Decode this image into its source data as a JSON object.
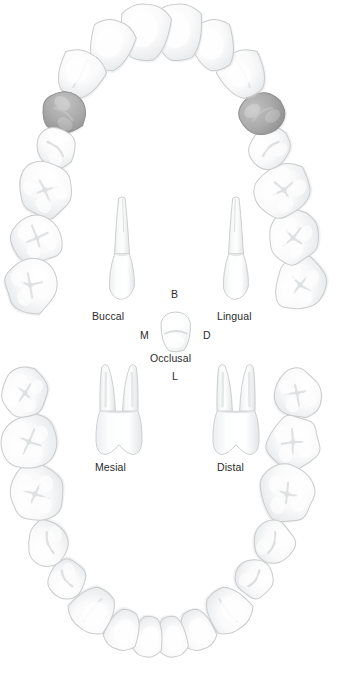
{
  "figure": {
    "type": "dental-arch-anatomy-diagram",
    "width": 346,
    "height": 676,
    "background_color": "#ffffff"
  },
  "colors": {
    "tooth_fill": "#fbfbfb",
    "tooth_outline": "#c9cbcc",
    "tooth_shade": "#e9eaeb",
    "highlight_fill": "#a9a9a9",
    "highlight_outline": "#8f8f8f",
    "label_text": "#2b2b2b"
  },
  "view_labels": {
    "buccal": "Buccal",
    "lingual": "Lingual",
    "mesial": "Mesial",
    "distal": "Distal",
    "occlusal": "Occlusal"
  },
  "orientation_labels": {
    "b": "B",
    "m": "M",
    "d": "D",
    "l": "L"
  },
  "arches": {
    "upper": {
      "name": "maxillary-arch",
      "teeth": [
        {
          "id": "ur8",
          "name": "upper-right-third-molar",
          "highlighted": false,
          "cx": 300,
          "cy": 285,
          "rx": 28,
          "ry": 26,
          "rot": -72,
          "crown": "molar"
        },
        {
          "id": "ur7",
          "name": "upper-right-second-molar",
          "highlighted": false,
          "cx": 293,
          "cy": 238,
          "rx": 27,
          "ry": 25,
          "rot": -62,
          "crown": "molar"
        },
        {
          "id": "ur6",
          "name": "upper-right-first-molar",
          "highlighted": false,
          "cx": 284,
          "cy": 190,
          "rx": 29,
          "ry": 28,
          "rot": -52,
          "crown": "molar"
        },
        {
          "id": "ur5",
          "name": "upper-right-second-premolar",
          "highlighted": false,
          "cx": 270,
          "cy": 148,
          "rx": 22,
          "ry": 21,
          "rot": -42,
          "crown": "premolar"
        },
        {
          "id": "ur4",
          "name": "upper-right-first-premolar",
          "highlighted": true,
          "cx": 262,
          "cy": 113,
          "rx": 23,
          "ry": 21,
          "rot": -34,
          "crown": "premolar"
        },
        {
          "id": "ur3",
          "name": "upper-right-canine",
          "highlighted": false,
          "cx": 243,
          "cy": 74,
          "rx": 23,
          "ry": 24,
          "rot": -28,
          "crown": "canine"
        },
        {
          "id": "ur2",
          "name": "upper-right-lateral-incisor",
          "highlighted": false,
          "cx": 213,
          "cy": 45,
          "rx": 22,
          "ry": 26,
          "rot": -18,
          "crown": "incisor"
        },
        {
          "id": "ur1",
          "name": "upper-right-central-incisor",
          "highlighted": false,
          "cx": 178,
          "cy": 32,
          "rx": 25,
          "ry": 29,
          "rot": -6,
          "crown": "incisor"
        },
        {
          "id": "ul1",
          "name": "upper-left-central-incisor",
          "highlighted": false,
          "cx": 145,
          "cy": 32,
          "rx": 25,
          "ry": 29,
          "rot": 6,
          "crown": "incisor"
        },
        {
          "id": "ul2",
          "name": "upper-left-lateral-incisor",
          "highlighted": false,
          "cx": 111,
          "cy": 45,
          "rx": 22,
          "ry": 26,
          "rot": 18,
          "crown": "incisor"
        },
        {
          "id": "ul3",
          "name": "upper-left-canine",
          "highlighted": false,
          "cx": 80,
          "cy": 74,
          "rx": 23,
          "ry": 24,
          "rot": 28,
          "crown": "canine"
        },
        {
          "id": "ul4",
          "name": "upper-left-first-premolar",
          "highlighted": true,
          "cx": 64,
          "cy": 113,
          "rx": 23,
          "ry": 21,
          "rot": 34,
          "crown": "premolar"
        },
        {
          "id": "ul5",
          "name": "upper-left-second-premolar",
          "highlighted": false,
          "cx": 56,
          "cy": 148,
          "rx": 22,
          "ry": 21,
          "rot": 42,
          "crown": "premolar"
        },
        {
          "id": "ul6",
          "name": "upper-left-first-molar",
          "highlighted": false,
          "cx": 45,
          "cy": 190,
          "rx": 29,
          "ry": 28,
          "rot": 52,
          "crown": "molar"
        },
        {
          "id": "ul7",
          "name": "upper-left-second-molar",
          "highlighted": false,
          "cx": 37,
          "cy": 238,
          "rx": 27,
          "ry": 25,
          "rot": 62,
          "crown": "molar"
        },
        {
          "id": "ul8",
          "name": "upper-left-third-molar",
          "highlighted": false,
          "cx": 30,
          "cy": 285,
          "rx": 28,
          "ry": 26,
          "rot": 72,
          "crown": "molar"
        }
      ]
    },
    "lower": {
      "name": "mandibular-arch",
      "teeth": [
        {
          "id": "lr8",
          "name": "lower-right-third-molar",
          "highlighted": false,
          "cx": 297,
          "cy": 393,
          "rx": 26,
          "ry": 24,
          "rot": 70,
          "crown": "molar"
        },
        {
          "id": "lr7",
          "name": "lower-right-second-molar",
          "highlighted": false,
          "cx": 293,
          "cy": 442,
          "rx": 28,
          "ry": 27,
          "rot": 78,
          "crown": "molar"
        },
        {
          "id": "lr6",
          "name": "lower-right-first-molar",
          "highlighted": false,
          "cx": 287,
          "cy": 494,
          "rx": 29,
          "ry": 28,
          "rot": 86,
          "crown": "molar"
        },
        {
          "id": "lr5",
          "name": "lower-right-second-premolar",
          "highlighted": false,
          "cx": 273,
          "cy": 543,
          "rx": 23,
          "ry": 22,
          "rot": 108,
          "crown": "premolar"
        },
        {
          "id": "lr4",
          "name": "lower-right-first-premolar",
          "highlighted": false,
          "cx": 255,
          "cy": 579,
          "rx": 20,
          "ry": 20,
          "rot": 124,
          "crown": "premolar"
        },
        {
          "id": "lr3",
          "name": "lower-right-canine",
          "highlighted": false,
          "cx": 228,
          "cy": 610,
          "rx": 22,
          "ry": 23,
          "rot": 142,
          "crown": "canine"
        },
        {
          "id": "lr2",
          "name": "lower-right-lateral-incisor",
          "highlighted": false,
          "cx": 197,
          "cy": 630,
          "rx": 17,
          "ry": 21,
          "rot": 160,
          "crown": "incisor"
        },
        {
          "id": "lr1",
          "name": "lower-right-central-incisor",
          "highlighted": false,
          "cx": 172,
          "cy": 637,
          "rx": 15,
          "ry": 21,
          "rot": 172,
          "crown": "incisor"
        },
        {
          "id": "ll1",
          "name": "lower-left-central-incisor",
          "highlighted": false,
          "cx": 148,
          "cy": 637,
          "rx": 15,
          "ry": 21,
          "rot": 188,
          "crown": "incisor"
        },
        {
          "id": "ll2",
          "name": "lower-left-lateral-incisor",
          "highlighted": false,
          "cx": 123,
          "cy": 630,
          "rx": 17,
          "ry": 21,
          "rot": 200,
          "crown": "incisor"
        },
        {
          "id": "ll3",
          "name": "lower-left-canine",
          "highlighted": false,
          "cx": 93,
          "cy": 610,
          "rx": 22,
          "ry": 23,
          "rot": 218,
          "crown": "canine"
        },
        {
          "id": "ll4",
          "name": "lower-left-first-premolar",
          "highlighted": false,
          "cx": 66,
          "cy": 579,
          "rx": 20,
          "ry": 20,
          "rot": 236,
          "crown": "premolar"
        },
        {
          "id": "ll5",
          "name": "lower-left-second-premolar",
          "highlighted": false,
          "cx": 49,
          "cy": 543,
          "rx": 23,
          "ry": 22,
          "rot": 252,
          "crown": "premolar"
        },
        {
          "id": "ll6",
          "name": "lower-left-first-molar",
          "highlighted": false,
          "cx": 35,
          "cy": 494,
          "rx": 29,
          "ry": 28,
          "rot": 274,
          "crown": "molar"
        },
        {
          "id": "ll7",
          "name": "lower-left-second-molar",
          "highlighted": false,
          "cx": 29,
          "cy": 442,
          "rx": 28,
          "ry": 27,
          "rot": 282,
          "crown": "molar"
        },
        {
          "id": "ll8",
          "name": "lower-left-third-molar",
          "highlighted": false,
          "cx": 25,
          "cy": 393,
          "rx": 26,
          "ry": 24,
          "rot": 290,
          "crown": "molar"
        }
      ]
    }
  },
  "central_views": {
    "buccal_view": {
      "label": "Buccal",
      "roots": 1,
      "cx": 122,
      "top": 198,
      "bottom": 298
    },
    "lingual_view": {
      "label": "Lingual",
      "roots": 1,
      "cx": 236,
      "top": 198,
      "bottom": 298
    },
    "occlusal_view": {
      "label": "Occlusal",
      "cx": 176,
      "cy": 332
    },
    "mesial_view": {
      "label": "Mesial",
      "roots": 2,
      "cx": 119,
      "top": 362,
      "bottom": 455
    },
    "distal_view": {
      "label": "Distal",
      "roots": 2,
      "cx": 236,
      "top": 362,
      "bottom": 455
    }
  }
}
